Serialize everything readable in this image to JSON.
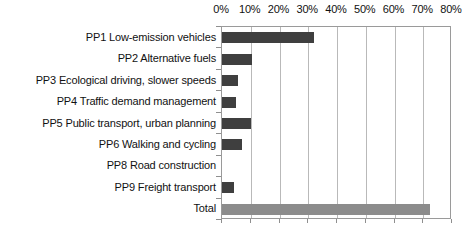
{
  "chart_data": {
    "type": "bar",
    "orientation": "horizontal",
    "title": "",
    "subtitle": "",
    "xlabel": "",
    "ylabel": "",
    "xlim": [
      0,
      80
    ],
    "xtick_labels": [
      "0%",
      "10%",
      "20%",
      "30%",
      "40%",
      "50%",
      "60%",
      "70%",
      "80%"
    ],
    "xtick_values": [
      0,
      10,
      20,
      30,
      40,
      50,
      60,
      70,
      80
    ],
    "grid": "vertical",
    "legend": "none",
    "categories": [
      "PP1 Low-emission vehicles",
      "PP2 Alternative fuels",
      "PP3 Ecological driving, slower speeds",
      "PP4 Traffic demand management",
      "PP5 Public transport, urban planning",
      "PP6 Walking and cycling",
      "PP8 Road construction",
      "PP9 Freight transport",
      "Total"
    ],
    "values": [
      32,
      10.5,
      5.6,
      4.9,
      10,
      7,
      0,
      4,
      72.5
    ],
    "value_unit": "%",
    "bar_colors": [
      "#3f3f3f",
      "#3f3f3f",
      "#3f3f3f",
      "#3f3f3f",
      "#3f3f3f",
      "#3f3f3f",
      "#3f3f3f",
      "#3f3f3f",
      "#8c8c8c"
    ],
    "colors": {
      "bar_primary": "#3f3f3f",
      "bar_total": "#8c8c8c",
      "gridline": "#b9b9b9",
      "axis_border": "#9a9a9a",
      "text": "#111111",
      "background": "#ffffff"
    }
  }
}
